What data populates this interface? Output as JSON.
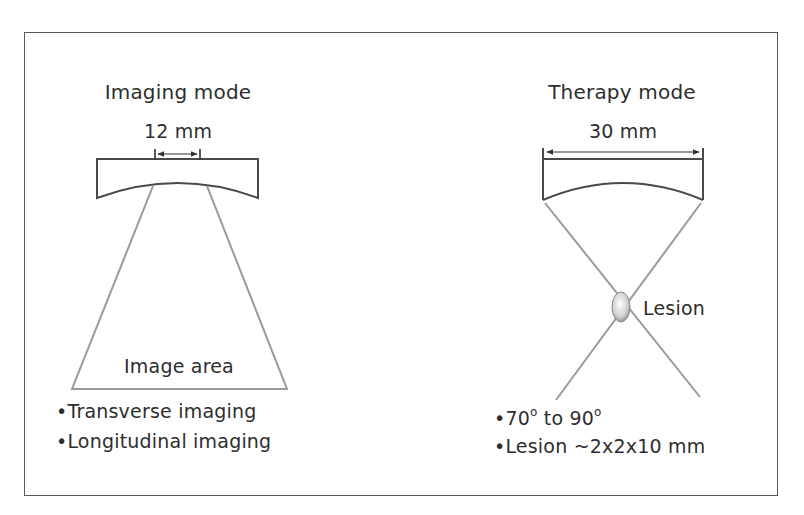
{
  "imaging": {
    "title": "Imaging mode",
    "aperture": "12 mm",
    "area_label": "Image area",
    "bullets": [
      "•Transverse imaging",
      "•Longitudinal imaging"
    ]
  },
  "therapy": {
    "title": "Therapy mode",
    "aperture": "30 mm",
    "lesion_label": "Lesion",
    "bullet_angle_a": "•70",
    "bullet_angle_deg": "o",
    "bullet_angle_mid": " to 90",
    "bullet_angle_deg2": "o",
    "bullet_lesion": "•Lesion ~2x2x10 mm"
  },
  "colors": {
    "frame": "#5a5a5a",
    "transducer": "#4a4a4a",
    "beam": "#9a9a9a",
    "text": "#2e2e2e"
  }
}
